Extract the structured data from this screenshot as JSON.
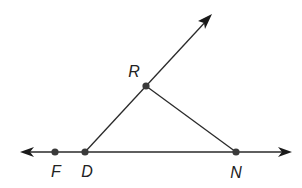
{
  "diagram": {
    "type": "geometry",
    "points": [
      {
        "id": "F",
        "label": "F"
      },
      {
        "id": "D",
        "label": "D"
      },
      {
        "id": "R",
        "label": "R"
      },
      {
        "id": "N",
        "label": "N"
      }
    ],
    "line": {
      "through": [
        "F",
        "D",
        "N"
      ],
      "arrows": "both"
    },
    "ray": {
      "from": "D",
      "through": "R"
    },
    "segments": [
      [
        "R",
        "N"
      ]
    ],
    "colors": {
      "stroke": "#2a2a2a",
      "point": "#3a3a3a",
      "label": "#222222"
    }
  }
}
